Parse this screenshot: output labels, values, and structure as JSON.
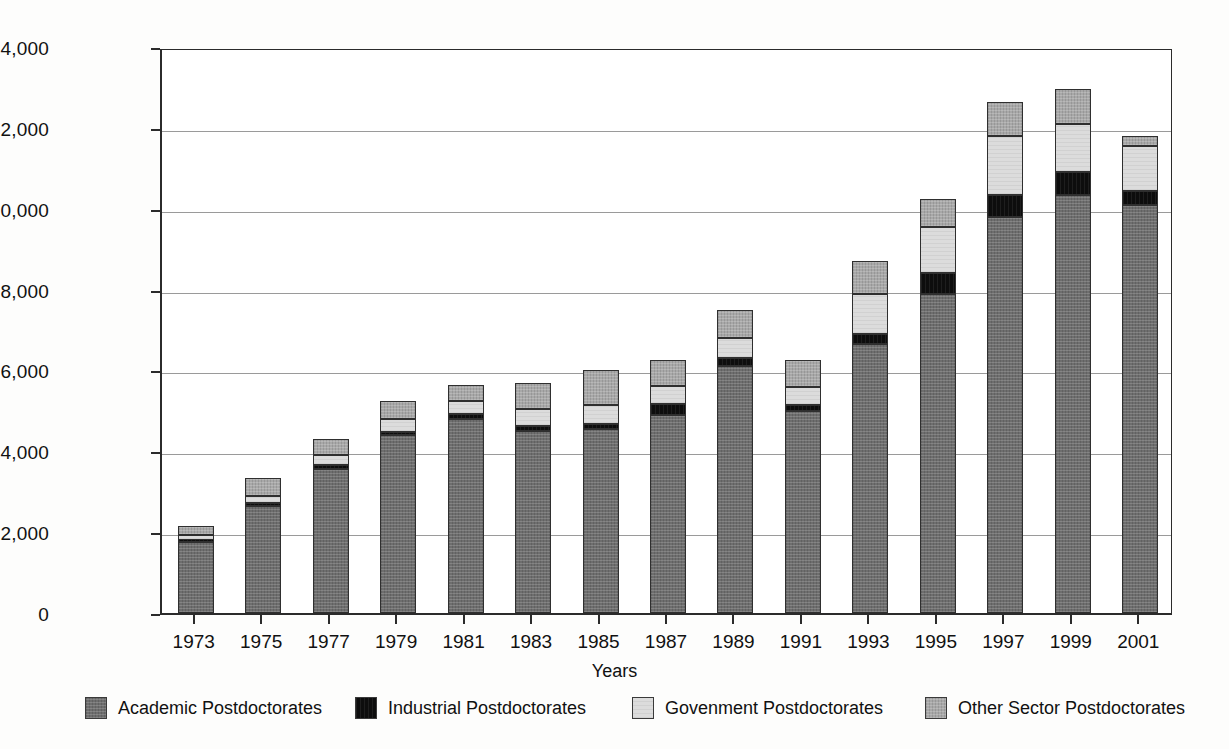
{
  "chart_data": {
    "type": "bar",
    "subtype": "stacked-vertical",
    "title": "",
    "xlabel": "Years",
    "ylabel": "Number",
    "ylim": [
      0,
      14000
    ],
    "ytick_step": 2000,
    "ytick_labels": [
      "0",
      "2,000",
      "4,000",
      "6,000",
      "8,000",
      "10,000",
      "12,000",
      "14,000"
    ],
    "ytick_values": [
      0,
      2000,
      4000,
      6000,
      8000,
      10000,
      12000,
      14000
    ],
    "grid": "horizontal",
    "legend_position": "bottom",
    "categories": [
      "1973",
      "1975",
      "1977",
      "1979",
      "1981",
      "1983",
      "1985",
      "1987",
      "1989",
      "1991",
      "1993",
      "1995",
      "1997",
      "1999",
      "2001"
    ],
    "series": [
      {
        "name": "Academic Postdoctorates",
        "color": "#6e6e6e",
        "values": [
          1750,
          2650,
          3550,
          4400,
          4800,
          4500,
          4550,
          4900,
          6100,
          5000,
          6650,
          7900,
          9800,
          10350,
          10100
        ]
      },
      {
        "name": "Industrial Postdoctorates",
        "color": "#0d0d0d",
        "values": [
          60,
          70,
          120,
          80,
          130,
          120,
          130,
          280,
          200,
          150,
          250,
          500,
          550,
          550,
          350
        ]
      },
      {
        "name": "Govenment Postdoctorates",
        "color": "#dcdcdc",
        "values": [
          130,
          180,
          230,
          320,
          320,
          430,
          470,
          430,
          500,
          430,
          1000,
          1150,
          1450,
          1200,
          1100
        ]
      },
      {
        "name": "Other Sector Postdoctorates",
        "color": "#a8a8a8",
        "values": [
          210,
          450,
          400,
          450,
          400,
          650,
          850,
          640,
          700,
          670,
          800,
          700,
          850,
          850,
          250
        ]
      }
    ],
    "totals": [
      2150,
      3350,
      4300,
      5250,
      5650,
      5700,
      6000,
      6250,
      7500,
      6250,
      8700,
      10250,
      12650,
      12950,
      11800
    ]
  },
  "axes": {
    "y_title": "Number",
    "x_title": "Years"
  },
  "legend": {
    "items": [
      {
        "label": "Academic Postdoctorates",
        "color": "#6e6e6e",
        "swatch": "academic-swatch"
      },
      {
        "label": "Industrial Postdoctorates",
        "color": "#0d0d0d",
        "swatch": "industrial-swatch"
      },
      {
        "label": "Govenment Postdoctorates",
        "color": "#dcdcdc",
        "swatch": "government-swatch"
      },
      {
        "label": "Other Sector Postdoctorates",
        "color": "#a8a8a8",
        "swatch": "other-sector-swatch"
      }
    ]
  }
}
